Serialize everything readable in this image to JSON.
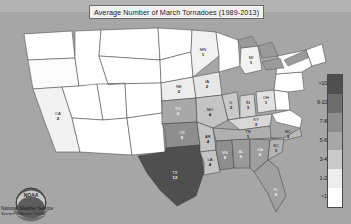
{
  "title": {
    "text": "Average Number of March Tornadoes (1989-2013)"
  },
  "legend": {
    "name": "tornado-count-legend",
    "bands": [
      {
        "label": ">10",
        "color": "#4f4f4f"
      },
      {
        "label": "9-10",
        "color": "#6d6d6d"
      },
      {
        "label": "7-8",
        "color": "#8e8e8e"
      },
      {
        "label": "5-6",
        "color": "#a8a8a8"
      },
      {
        "label": "3-4",
        "color": "#c9c9c9"
      },
      {
        "label": "1-2",
        "color": "#ededed"
      },
      {
        "label": "<1",
        "color": "#ffffff"
      }
    ]
  },
  "attribution": {
    "logo_name": "noaa-logo",
    "line1": "National Weather Service",
    "line2": "Storm Prediction Center"
  },
  "chart_data": {
    "type": "heatmap",
    "title": "Average Number of March Tornadoes (1989-2013)",
    "xlabel": "",
    "ylabel": "",
    "legend_position": "right",
    "value_unit": "average tornadoes per March",
    "bins": [
      {
        "label": "<1",
        "min": 0,
        "max": 1,
        "color": "#ffffff"
      },
      {
        "label": "1-2",
        "min": 1,
        "max": 2,
        "color": "#ededed"
      },
      {
        "label": "3-4",
        "min": 3,
        "max": 4,
        "color": "#c9c9c9"
      },
      {
        "label": "5-6",
        "min": 5,
        "max": 6,
        "color": "#a8a8a8"
      },
      {
        "label": "7-8",
        "min": 7,
        "max": 8,
        "color": "#8e8e8e"
      },
      {
        "label": "9-10",
        "min": 9,
        "max": 10,
        "color": "#6d6d6d"
      },
      {
        "label": ">10",
        "min": 10,
        "max": null,
        "color": "#4f4f4f"
      }
    ],
    "categories": [
      "TX",
      "OK",
      "KS",
      "MS",
      "AL",
      "GA",
      "MO",
      "AR",
      "LA",
      "IL",
      "FL",
      "NC",
      "MI",
      "MN",
      "NE",
      "IA",
      "OH",
      "IN",
      "KY",
      "TN",
      "SC",
      "CA"
    ],
    "values": [
      12,
      8,
      6,
      8,
      6,
      6,
      4,
      4,
      4,
      3,
      6,
      3,
      1,
      1,
      2,
      2,
      1,
      3,
      3,
      1,
      1,
      2
    ],
    "regions": [
      {
        "code": "TX",
        "value": "12",
        "band": ">10",
        "fill": "#4f4f4f",
        "label_light": true
      },
      {
        "code": "OK",
        "value": "8",
        "band": "7-8",
        "fill": "#8e8e8e",
        "label_light": true
      },
      {
        "code": "KS",
        "value": "6",
        "band": "5-6",
        "fill": "#a8a8a8",
        "label_light": true
      },
      {
        "code": "MS",
        "value": "8",
        "band": "7-8",
        "fill": "#8e8e8e",
        "label_light": true
      },
      {
        "code": "AL",
        "value": "6",
        "band": "5-6",
        "fill": "#9a9a9a",
        "label_light": true
      },
      {
        "code": "GA",
        "value": "6",
        "band": "5-6",
        "fill": "#9e9e9e",
        "label_light": true
      },
      {
        "code": "FL",
        "value": "6",
        "band": "5-6",
        "fill": "#a0a0a0",
        "label_light": true
      },
      {
        "code": "MO",
        "value": "4",
        "band": "3-4",
        "fill": "#c4c4c4",
        "label_light": false
      },
      {
        "code": "AR",
        "value": "4",
        "band": "3-4",
        "fill": "#c4c4c4",
        "label_light": false
      },
      {
        "code": "LA",
        "value": "4",
        "band": "3-4",
        "fill": "#c4c4c4",
        "label_light": false
      },
      {
        "code": "IL",
        "value": "3",
        "band": "3-4",
        "fill": "#c9c9c9",
        "label_light": false
      },
      {
        "code": "IN",
        "value": "3",
        "band": "3-4",
        "fill": "#d4d4d4",
        "label_light": false
      },
      {
        "code": "KY",
        "value": "3",
        "band": "3-4",
        "fill": "#d8d8d8",
        "label_light": false
      },
      {
        "code": "NC",
        "value": "3",
        "band": "3-4",
        "fill": "#b8b8b8",
        "label_light": false
      },
      {
        "code": "TN",
        "value": "1",
        "band": "1-2",
        "fill": "#b0b0b0",
        "label_light": false
      },
      {
        "code": "SC",
        "value": "1",
        "band": "1-2",
        "fill": "#b4b4b4",
        "label_light": false
      },
      {
        "code": "OH",
        "value": "1",
        "band": "1-2",
        "fill": "#e2e2e2",
        "label_light": false
      },
      {
        "code": "NE",
        "value": "2",
        "band": "1-2",
        "fill": "#ededed",
        "label_light": false
      },
      {
        "code": "IA",
        "value": "2",
        "band": "1-2",
        "fill": "#e6e6e6",
        "label_light": false
      },
      {
        "code": "MN",
        "value": "1",
        "band": "1-2",
        "fill": "#f2f2f2",
        "label_light": false
      },
      {
        "code": "MI",
        "value": "1",
        "band": "1-2",
        "fill": "#f2f2f2",
        "label_light": false
      },
      {
        "code": "CA",
        "value": "2",
        "band": "1-2",
        "fill": "#f2f2f2",
        "label_light": false
      }
    ]
  },
  "map": {
    "name": "us-choropleth-map",
    "states": [
      {
        "code": "WA",
        "value": "",
        "fill": "#ffffff",
        "d": "M24,34 L72,31 L75,58 L28,60 Z",
        "lx": 48,
        "ly": 45,
        "light": false
      },
      {
        "code": "OR",
        "value": "",
        "fill": "#fbfbfb",
        "d": "M28,60 L75,58 L79,86 L33,89 Z",
        "lx": 52,
        "ly": 73,
        "light": false
      },
      {
        "code": "CA",
        "value": "2",
        "fill": "#f2f2f2",
        "d": "M33,89 L62,87 L72,118 L80,152 L56,152 L44,120 Z",
        "lx": 58,
        "ly": 116,
        "light": false
      },
      {
        "code": "ID",
        "value": "",
        "fill": "#ffffff",
        "d": "M75,31 L101,30 L99,56 L108,84 L79,86 L75,58 Z",
        "lx": 91,
        "ly": 58,
        "light": false
      },
      {
        "code": "NV",
        "value": "",
        "fill": "#ffffff",
        "d": "M72,118 L62,87 L79,86 L97,84 L103,120 Z",
        "lx": 84,
        "ly": 104,
        "light": false
      },
      {
        "code": "UT",
        "value": "",
        "fill": "#ffffff",
        "d": "M97,84 L108,84 L125,83 L127,118 L103,120 Z",
        "lx": 114,
        "ly": 101,
        "light": false
      },
      {
        "code": "AZ",
        "value": "",
        "fill": "#ffffff",
        "d": "M103,120 L127,118 L132,155 L80,152 L72,118 Z",
        "lx": 104,
        "ly": 137,
        "light": false
      },
      {
        "code": "MT",
        "value": "",
        "fill": "#ffffff",
        "d": "M101,30 L158,28 L160,60 L99,56 Z",
        "lx": 129,
        "ly": 43,
        "light": false
      },
      {
        "code": "WY",
        "value": "",
        "fill": "#ffffff",
        "d": "M99,56 L160,60 L161,83 L108,84 L99,56 Z",
        "lx": 131,
        "ly": 71,
        "light": false
      },
      {
        "code": "CO",
        "value": "",
        "fill": "#ffffff",
        "d": "M108,84 L161,83 L162,113 L127,118 L125,83 Z",
        "lx": 144,
        "ly": 99,
        "light": false
      },
      {
        "code": "NM",
        "value": "",
        "fill": "#ffffff",
        "d": "M127,118 L162,113 L165,152 L132,155 Z",
        "lx": 147,
        "ly": 134,
        "light": false
      },
      {
        "code": "ND",
        "value": "",
        "fill": "#ffffff",
        "d": "M158,28 L192,30 L191,52 L160,60 Z",
        "lx": 175,
        "ly": 42,
        "light": false
      },
      {
        "code": "SD",
        "value": "",
        "fill": "#ffffff",
        "d": "M160,60 L191,52 L193,77 L161,83 Z",
        "lx": 177,
        "ly": 67,
        "light": false
      },
      {
        "code": "NE",
        "value": "2",
        "fill": "#ededed",
        "d": "M161,83 L193,77 L196,98 L162,101 Z",
        "lx": 179,
        "ly": 89,
        "light": false
      },
      {
        "code": "KS",
        "value": "6",
        "fill": "#a8a8a8",
        "d": "M162,101 L196,98 L197,122 L162,124 Z",
        "lx": 178,
        "ly": 111,
        "light": true
      },
      {
        "code": "OK",
        "value": "8",
        "fill": "#8e8e8e",
        "d": "M162,124 L197,122 L200,145 L166,148 L165,130 Z",
        "lx": 182,
        "ly": 135,
        "light": true
      },
      {
        "code": "TX",
        "value": "12",
        "fill": "#4f4f4f",
        "d": "M165,152 L166,148 L200,145 L204,172 L196,196 L177,206 L160,190 L147,173 L138,156 Z",
        "lx": 175,
        "ly": 175,
        "light": true
      },
      {
        "code": "MN",
        "value": "1",
        "fill": "#f2f2f2",
        "d": "M192,30 L216,32 L219,56 L193,77 L191,52 Z",
        "lx": 203,
        "ly": 52,
        "light": false
      },
      {
        "code": "IA",
        "value": "2",
        "fill": "#e6e6e6",
        "d": "M193,77 L219,72 L222,95 L196,98 Z",
        "lx": 207,
        "ly": 84,
        "light": false
      },
      {
        "code": "MO",
        "value": "4",
        "fill": "#c4c4c4",
        "d": "M196,98 L222,95 L228,120 L213,128 L197,122 Z",
        "lx": 210,
        "ly": 112,
        "light": false
      },
      {
        "code": "AR",
        "value": "4",
        "fill": "#c4c4c4",
        "d": "M197,122 L213,128 L216,150 L200,152 L200,145 Z",
        "lx": 208,
        "ly": 139,
        "light": false
      },
      {
        "code": "LA",
        "value": "4",
        "fill": "#c4c4c4",
        "d": "M200,152 L216,150 L220,172 L204,175 L204,162 Z",
        "lx": 210,
        "ly": 162,
        "light": false
      },
      {
        "code": "WI",
        "value": "",
        "fill": "#ffffff",
        "d": "M216,32 L238,40 L240,66 L219,72 L219,56 Z",
        "lx": 229,
        "ly": 54,
        "light": false
      },
      {
        "code": "IL",
        "value": "3",
        "fill": "#c9c9c9",
        "d": "M222,95 L237,92 L240,118 L228,120 Z",
        "lx": 231,
        "ly": 105,
        "light": false
      },
      {
        "code": "MI",
        "value": "1",
        "fill": "#f2f2f2",
        "d": "M241,48 L258,46 L262,70 L245,74 L240,66 Z",
        "lx": 251,
        "ly": 60,
        "light": false
      },
      {
        "code": "IN",
        "value": "3",
        "fill": "#d4d4d4",
        "d": "M240,96 L254,94 L256,116 L240,118 Z",
        "lx": 248,
        "ly": 105,
        "light": false
      },
      {
        "code": "OH",
        "value": "1",
        "fill": "#e2e2e2",
        "d": "M256,92 L274,90 L276,110 L258,113 Z",
        "lx": 266,
        "ly": 100,
        "light": false
      },
      {
        "code": "KY",
        "value": "3",
        "fill": "#d8d8d8",
        "d": "M228,120 L256,116 L272,114 L270,126 L240,130 Z",
        "lx": 256,
        "ly": 122,
        "light": false
      },
      {
        "code": "TN",
        "value": "1",
        "fill": "#b0b0b0",
        "d": "M213,128 L240,130 L270,126 L271,138 L216,141 Z",
        "lx": 248,
        "ly": 134,
        "light": false
      },
      {
        "code": "MS",
        "value": "8",
        "fill": "#8e8e8e",
        "d": "M216,141 L232,140 L234,168 L220,170 L216,150 Z",
        "lx": 225,
        "ly": 155,
        "light": true
      },
      {
        "code": "AL",
        "value": "6",
        "fill": "#9a9a9a",
        "d": "M232,140 L250,139 L250,168 L234,168 Z",
        "lx": 241,
        "ly": 154,
        "light": true
      },
      {
        "code": "GA",
        "value": "6",
        "fill": "#9e9e9e",
        "d": "M250,139 L270,140 L268,160 L254,172 L250,168 Z",
        "lx": 260,
        "ly": 152,
        "light": true
      },
      {
        "code": "FL",
        "value": "6",
        "fill": "#a0a0a0",
        "d": "M254,172 L268,160 L278,168 L286,196 L276,212 L268,194 L258,178 Z",
        "lx": 276,
        "ly": 192,
        "light": true
      },
      {
        "code": "SC",
        "value": "1",
        "fill": "#b4b4b4",
        "d": "M270,140 L284,138 L282,152 L268,160 Z",
        "lx": 276,
        "ly": 148,
        "light": false
      },
      {
        "code": "NC",
        "value": "3",
        "fill": "#b8b8b8",
        "d": "M271,138 L284,138 L300,128 L302,136 L286,140 Z",
        "lx": 288,
        "ly": 134,
        "light": false
      },
      {
        "code": "VA",
        "value": "",
        "fill": "#ffffff",
        "d": "M272,114 L290,110 L302,118 L300,128 L276,122 Z",
        "lx": 286,
        "ly": 119,
        "light": false
      },
      {
        "code": "WV",
        "value": "",
        "fill": "#ffffff",
        "d": "M274,90 L288,92 L290,110 L276,110 Z",
        "lx": 281,
        "ly": 100,
        "light": false
      },
      {
        "code": "PA",
        "value": "",
        "fill": "#ffffff",
        "d": "M276,74 L302,72 L304,90 L288,92 L274,90 Z",
        "lx": 290,
        "ly": 82,
        "light": false
      },
      {
        "code": "NY",
        "value": "",
        "fill": "#ffffff",
        "d": "M278,56 L306,50 L312,66 L302,72 L276,74 Z",
        "lx": 294,
        "ly": 63,
        "light": false
      },
      {
        "code": "NEW-ENGLAND",
        "value": "",
        "fill": "#ffffff",
        "d": "M306,50 L322,44 L326,62 L312,66 Z",
        "lx": 316,
        "ly": 55,
        "light": false
      }
    ]
  }
}
